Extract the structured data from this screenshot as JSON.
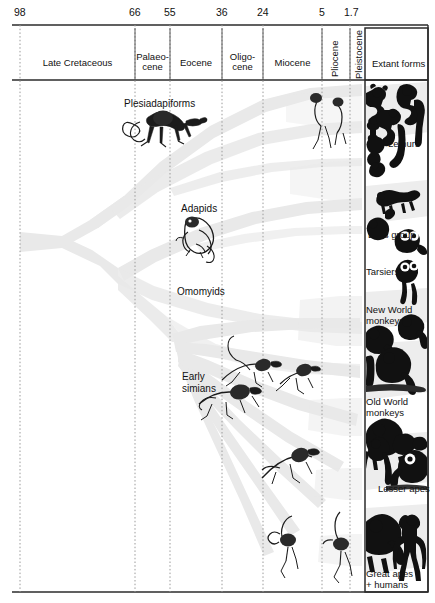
{
  "figure": {
    "width": 435,
    "height": 603,
    "background_color": "#ffffff",
    "ink_color": "#111111",
    "fan_color": "#e9e9e9"
  },
  "axis": {
    "label": "Millions of years ago",
    "ticks": [
      {
        "value": "98",
        "x": 20
      },
      {
        "value": "66",
        "x": 135
      },
      {
        "value": "55",
        "x": 170
      },
      {
        "value": "36",
        "x": 222
      },
      {
        "value": "24",
        "x": 263
      },
      {
        "value": "5",
        "x": 322
      },
      {
        "value": "1.7",
        "x": 350
      }
    ],
    "line_y": 25,
    "row_bottom_y": 80
  },
  "epochs": [
    {
      "name": "Late Cretaceous",
      "x_start": 20,
      "x_end": 135,
      "orientation": "horizontal"
    },
    {
      "name": "Palaeo-\ncene",
      "x_start": 135,
      "x_end": 170,
      "orientation": "horizontal"
    },
    {
      "name": "Eocene",
      "x_start": 170,
      "x_end": 222,
      "orientation": "horizontal"
    },
    {
      "name": "Oligo-\ncene",
      "x_start": 222,
      "x_end": 263,
      "orientation": "horizontal"
    },
    {
      "name": "Miocene",
      "x_start": 263,
      "x_end": 322,
      "orientation": "horizontal"
    },
    {
      "name": "Pliocene",
      "x_start": 322,
      "x_end": 350,
      "orientation": "vertical"
    },
    {
      "name": "Pleistocene",
      "x_start": 350,
      "x_end": 365,
      "orientation": "vertical"
    },
    {
      "name": "Extant forms",
      "x_start": 365,
      "x_end": 428,
      "orientation": "horizontal"
    }
  ],
  "fossil_taxa": [
    {
      "name": "Plesiadapiforms",
      "x": 124,
      "y": 98
    },
    {
      "name": "Adapids",
      "x": 181,
      "y": 203
    },
    {
      "name": "Omomyids",
      "x": 177,
      "y": 286
    },
    {
      "name": "Early\nsimians",
      "x": 182,
      "y": 371
    }
  ],
  "extant_groups": [
    {
      "name": "Lemurs",
      "x": 388,
      "y": 139
    },
    {
      "name": "Loris group",
      "x": 368,
      "y": 230
    },
    {
      "name": "Tarsiers",
      "x": 366,
      "y": 267
    },
    {
      "name": "New World\nmonkeys",
      "x": 366,
      "y": 305
    },
    {
      "name": "Old World\nmonkeys",
      "x": 366,
      "y": 397
    },
    {
      "name": "Lesser apes",
      "x": 378,
      "y": 484
    },
    {
      "name": "Great apes\n+ humans",
      "x": 366,
      "y": 569
    }
  ]
}
